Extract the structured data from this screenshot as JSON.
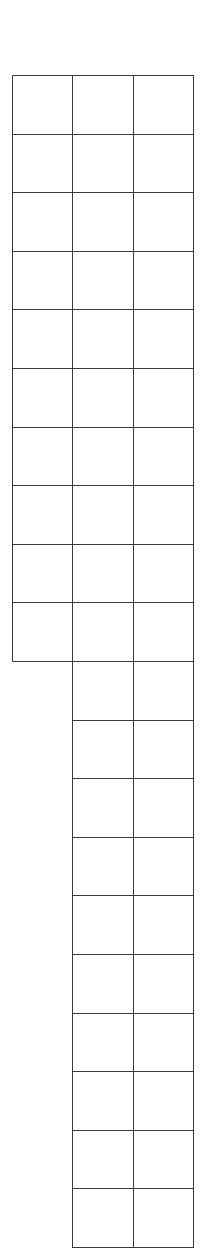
{
  "grid": {
    "line_color": "#3a3a3a",
    "background": "#ffffff",
    "origin_y": 75,
    "row_height": 58.6,
    "column_x": [
      12,
      72,
      133,
      193
    ],
    "left_column_rows": 10,
    "right_columns_rows": 20,
    "total_rows_visible": 20
  }
}
